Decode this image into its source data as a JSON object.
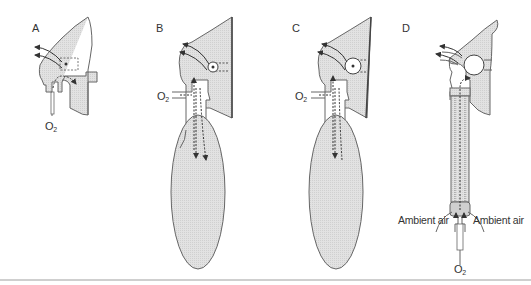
{
  "figure": {
    "panels": [
      {
        "id": "A",
        "label": "A",
        "device": "simple face mask",
        "labels": {
          "o2": "O",
          "o2_sub": "2"
        }
      },
      {
        "id": "B",
        "label": "B",
        "device": "partial rebreathing mask with reservoir bag",
        "labels": {
          "o2": "O",
          "o2_sub": "2"
        }
      },
      {
        "id": "C",
        "label": "C",
        "device": "non-rebreathing mask with reservoir bag",
        "labels": {
          "o2": "O",
          "o2_sub": "2"
        }
      },
      {
        "id": "D",
        "label": "D",
        "device": "venturi mask",
        "labels": {
          "ambient_left": "Ambient air",
          "ambient_right": "Ambient air",
          "o2": "O",
          "o2_sub": "2"
        }
      }
    ],
    "colors": {
      "outline": "#555555",
      "fill": "#e4e4e4",
      "bag_fill": "#dcdcdc",
      "arrow": "#333333",
      "rule": "#cfcfcf"
    }
  }
}
